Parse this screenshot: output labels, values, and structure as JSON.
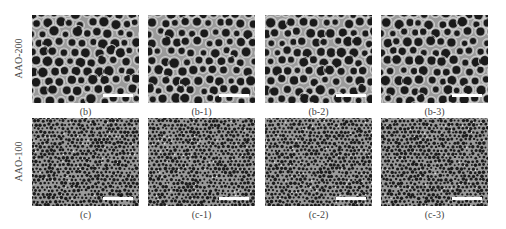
{
  "figure": {
    "rows": [
      {
        "label": "AAO-200",
        "panels": [
          {
            "caption": "(b)"
          },
          {
            "caption": "(b-1)"
          },
          {
            "caption": "(b-2)"
          },
          {
            "caption": "(b-3)"
          }
        ]
      },
      {
        "label": "AAO-100",
        "panels": [
          {
            "caption": "(c)"
          },
          {
            "caption": "(c-1)"
          },
          {
            "caption": "(c-2)"
          },
          {
            "caption": "(c-3)"
          }
        ]
      }
    ],
    "colors": {
      "background": "#ffffff",
      "membrane": "#9a9a9a",
      "pore": "#1a1a1a",
      "pore_rim": "#d8d8d8",
      "scalebar": "#ffffff"
    }
  }
}
